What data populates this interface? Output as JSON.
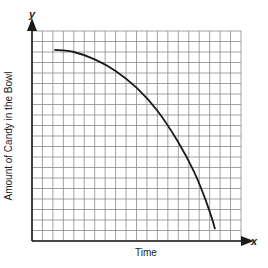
{
  "chart_data": {
    "type": "line",
    "title": "",
    "xlabel": "Time",
    "ylabel": "Amount of Candy in the Bowl",
    "x_axis_letter": "x",
    "y_axis_letter": "y",
    "grid": true,
    "grid_cells": {
      "x": 20,
      "y": 20
    },
    "xlim": [
      0,
      20
    ],
    "ylim": [
      0,
      20
    ],
    "tick_labels": false,
    "series": [
      {
        "name": "Candy remaining",
        "color": "#1a1a1a",
        "description": "Concave-down decreasing curve: starts nearly flat near top, falls increasingly steeply, ending almost vertical near the x-axis",
        "x": [
          2.2,
          4,
          6,
          8,
          10,
          12,
          14,
          15.5,
          16.5,
          17.2,
          17.5
        ],
        "y": [
          18.2,
          18.0,
          17.3,
          16.2,
          14.6,
          12.4,
          9.4,
          6.6,
          4.2,
          2.2,
          1.2
        ]
      }
    ],
    "legend": null
  },
  "colors": {
    "grid": "#8a8a8a",
    "axis": "#1a1a1a",
    "curve": "#1a1a1a",
    "background": "#ffffff"
  }
}
